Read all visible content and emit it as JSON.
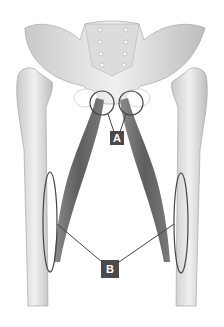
{
  "figure": {
    "background": "#ffffff",
    "colors": {
      "bone": "#e6e6e6",
      "bone_shade": "#b8b8b8",
      "muscle": "#6e6e6e",
      "muscle_dark": "#555555",
      "outline": "#444444",
      "label_bg": "#4a4a4a",
      "label_text": "#ffffff"
    }
  },
  "labels": {
    "a": {
      "text": "A",
      "target": "muscle origins at pubis (two circles)"
    },
    "b": {
      "text": "B",
      "target": "muscle insertions on femurs (two ellipses)"
    }
  }
}
